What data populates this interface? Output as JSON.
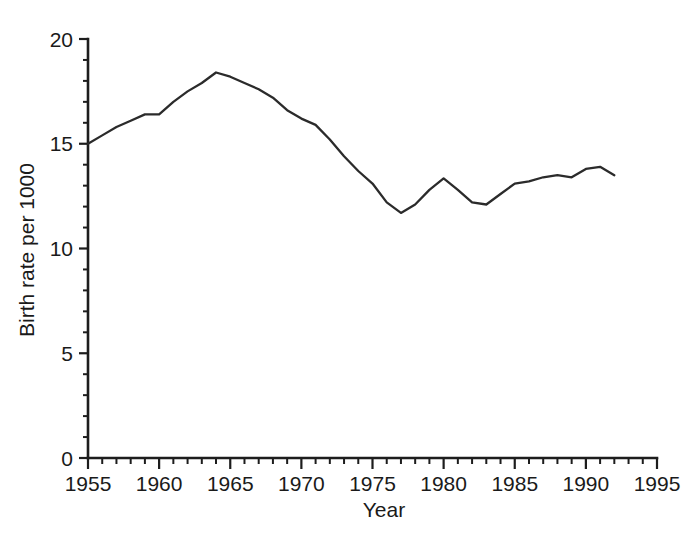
{
  "chart_data": {
    "type": "line",
    "title": "",
    "xlabel": "Year",
    "ylabel": "Birth rate per 1000",
    "xlim": [
      1955,
      1995
    ],
    "ylim": [
      0,
      20
    ],
    "grid": false,
    "legend": null,
    "x_tick_labels": [
      "1955",
      "1960",
      "1965",
      "1970",
      "1975",
      "1980",
      "1985",
      "1990",
      "1995"
    ],
    "x_ticks": [
      1955,
      1960,
      1965,
      1970,
      1975,
      1980,
      1985,
      1990,
      1995
    ],
    "x_minor_tick_step": 1,
    "y_tick_labels": [
      "0",
      "5",
      "10",
      "15",
      "20"
    ],
    "y_ticks": [
      0,
      5,
      10,
      15,
      20
    ],
    "y_minor_tick_step": 1,
    "series": [
      {
        "name": "Birth rate per 1000",
        "color": "#2b2b2b",
        "x": [
          1955,
          1956,
          1957,
          1958,
          1959,
          1960,
          1961,
          1962,
          1963,
          1964,
          1965,
          1966,
          1967,
          1968,
          1969,
          1970,
          1971,
          1972,
          1973,
          1974,
          1975,
          1976,
          1977,
          1978,
          1979,
          1980,
          1981,
          1982,
          1983,
          1984,
          1985,
          1986,
          1987,
          1988,
          1989,
          1990,
          1991,
          1992
        ],
        "values": [
          15.0,
          15.4,
          15.8,
          16.1,
          16.4,
          16.4,
          17.0,
          17.5,
          17.9,
          18.4,
          18.2,
          17.9,
          17.6,
          17.2,
          16.6,
          16.2,
          15.9,
          15.2,
          14.4,
          13.7,
          13.1,
          12.2,
          11.7,
          12.1,
          12.8,
          13.35,
          12.8,
          12.2,
          12.1,
          12.6,
          13.1,
          13.2,
          13.4,
          13.5,
          13.4,
          13.8,
          13.9,
          13.5
        ]
      }
    ],
    "annotations": []
  },
  "axes": {
    "x_title": "Year",
    "y_title": "Birth rate per 1000"
  },
  "caption": {
    "partial_text": ""
  }
}
